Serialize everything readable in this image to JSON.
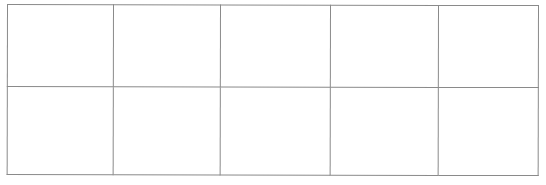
{
  "document": {
    "kind": "blank-grid-table",
    "description": "Scanned blank ruled grid with 5 columns and 2 rows; all cells are empty",
    "background_color": "#ffffff",
    "line_color": "#8a8a8a"
  },
  "grid": {
    "columns": 5,
    "rows": 2,
    "has_header_row": false,
    "column_headers": [
      "",
      "",
      "",
      "",
      ""
    ],
    "cells": [
      [
        "",
        "",
        "",
        "",
        ""
      ],
      [
        "",
        "",
        "",
        "",
        ""
      ]
    ]
  }
}
